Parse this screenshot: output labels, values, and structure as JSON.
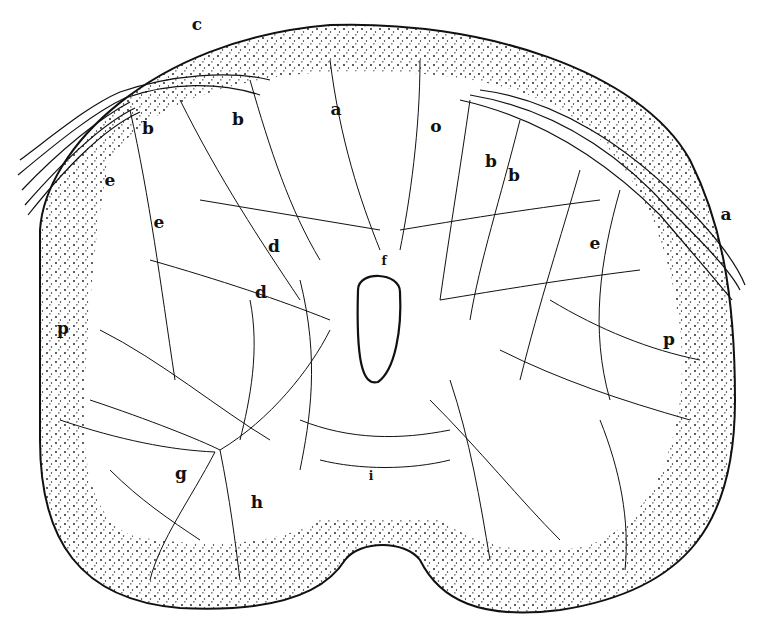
{
  "figure": {
    "colors": {
      "ink": "#111111",
      "paper": "#ffffff"
    },
    "labels": [
      {
        "id": "c",
        "text": "c",
        "x": 197,
        "y": 24
      },
      {
        "id": "b1",
        "text": "b",
        "x": 148,
        "y": 128
      },
      {
        "id": "b2",
        "text": "b",
        "x": 238,
        "y": 119
      },
      {
        "id": "a1",
        "text": "a",
        "x": 336,
        "y": 109
      },
      {
        "id": "o",
        "text": "o",
        "x": 436,
        "y": 126
      },
      {
        "id": "b3",
        "text": "b",
        "x": 491,
        "y": 161
      },
      {
        "id": "b4",
        "text": "b",
        "x": 514,
        "y": 175
      },
      {
        "id": "a2",
        "text": "a",
        "x": 726,
        "y": 214
      },
      {
        "id": "e1",
        "text": "e",
        "x": 110,
        "y": 180
      },
      {
        "id": "e2",
        "text": "e",
        "x": 159,
        "y": 222
      },
      {
        "id": "e3",
        "text": "e",
        "x": 595,
        "y": 243
      },
      {
        "id": "d1",
        "text": "d",
        "x": 274,
        "y": 246
      },
      {
        "id": "d2",
        "text": "d",
        "x": 261,
        "y": 292
      },
      {
        "id": "f",
        "text": "f",
        "x": 384,
        "y": 261,
        "small": true
      },
      {
        "id": "p1",
        "text": "p",
        "x": 63,
        "y": 328
      },
      {
        "id": "p2",
        "text": "p",
        "x": 669,
        "y": 339
      },
      {
        "id": "g",
        "text": "g",
        "x": 181,
        "y": 473
      },
      {
        "id": "h",
        "text": "h",
        "x": 257,
        "y": 502
      },
      {
        "id": "i",
        "text": "i",
        "x": 371,
        "y": 476,
        "small": true
      }
    ]
  }
}
